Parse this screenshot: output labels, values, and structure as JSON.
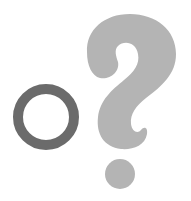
{
  "figure": {
    "alt": "Circle and question mark",
    "background": "#ffffff",
    "circle": {
      "label": "O",
      "color": "#6b6b6b",
      "icon": "ring-icon"
    },
    "question_mark": {
      "label": "?",
      "color": "#b4b4b4",
      "icon": "question-mark-icon"
    }
  }
}
